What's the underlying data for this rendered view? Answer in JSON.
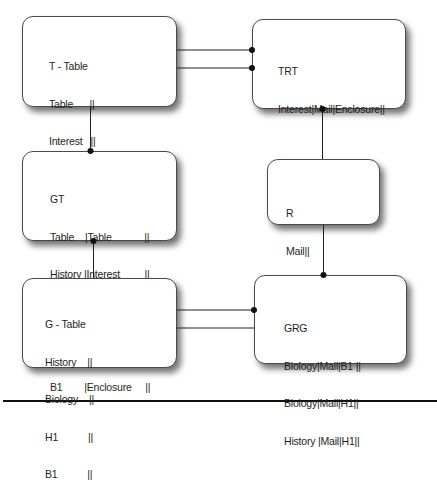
{
  "diagram": {
    "type": "entity-relationship",
    "boxes": [
      {
        "id": "t-table",
        "title": "T - Table",
        "rows": [
          "Table      ||",
          "Interest   ||",
          "Enclosure||"
        ]
      },
      {
        "id": "trt",
        "title": "TRT",
        "rows": [
          "Interest|Mail|Enclosure||"
        ]
      },
      {
        "id": "gt",
        "title": "GT",
        "rows": [
          "Table    |Table            ||",
          "History |Interest         ||",
          "Biology|Interest         ||",
          "H1        |Enclosure     ||",
          "B1        |Enclosure     ||"
        ]
      },
      {
        "id": "r",
        "title": "R",
        "rows": [
          "Mail||"
        ]
      },
      {
        "id": "g-table",
        "title": "G - Table",
        "rows": [
          "History    ||",
          "Biology    ||",
          "H1           ||",
          "B1           ||"
        ]
      },
      {
        "id": "grg",
        "title": "GRG",
        "rows": [
          "Biology|Mail|B1 ||",
          "Biology|Mail|H1||",
          "History |Mail|H1||"
        ]
      }
    ],
    "connections": [
      {
        "from": "t-table",
        "to": "trt",
        "end_dot": "trt",
        "y": 50
      },
      {
        "from": "t-table",
        "to": "trt",
        "end_dot": "trt",
        "y": 68
      },
      {
        "from": "t-table",
        "to": "gt",
        "end_dot": "gt"
      },
      {
        "from": "gt",
        "to": "g-table",
        "end_dot": "gt"
      },
      {
        "from": "trt",
        "to": "r",
        "end_dot": "trt"
      },
      {
        "from": "r",
        "to": "grg",
        "end_dot": "grg"
      },
      {
        "from": "g-table",
        "to": "grg",
        "end_dot": "grg",
        "y": 310
      },
      {
        "from": "g-table",
        "to": "grg",
        "end_dot": "none",
        "y": 328
      }
    ],
    "colors": {
      "line": "#231f20",
      "box_border": "#4a4a4a",
      "background": "#ffffff"
    }
  }
}
